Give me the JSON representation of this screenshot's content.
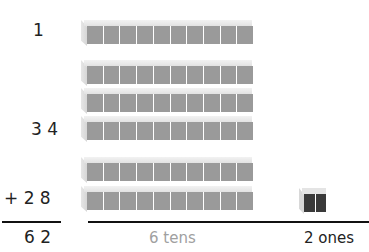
{
  "equation": {
    "carry": "1",
    "addend1": "3 4",
    "addend2": "+ 2 8",
    "sum": "6 2"
  },
  "model": {
    "tens_rods": 6,
    "units_per_rod": 10,
    "ones_cubes": 2,
    "rod_color": "#9a9a9a",
    "ones_color": "#3a3a3a"
  },
  "labels": {
    "tens": "6 tens",
    "ones": "2 ones",
    "tens_color": "#a0a0a0",
    "ones_color": "#222222"
  }
}
